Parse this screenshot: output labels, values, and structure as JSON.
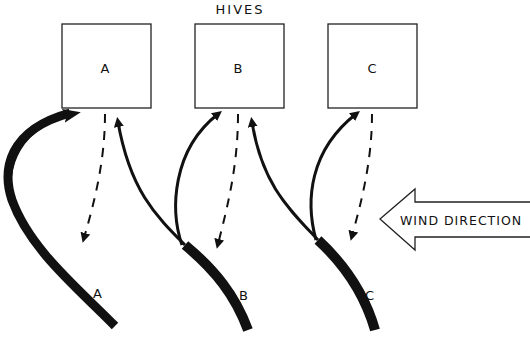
{
  "title": "HIVES",
  "hives": [
    {
      "label": "A"
    },
    {
      "label": "B"
    },
    {
      "label": "C"
    }
  ],
  "flight_paths": [
    {
      "label": "A"
    },
    {
      "label": "B"
    },
    {
      "label": "C"
    }
  ],
  "wind": {
    "label": "WIND DIRECTION"
  },
  "colors": {
    "ink": "#111111",
    "background": "#ffffff"
  }
}
